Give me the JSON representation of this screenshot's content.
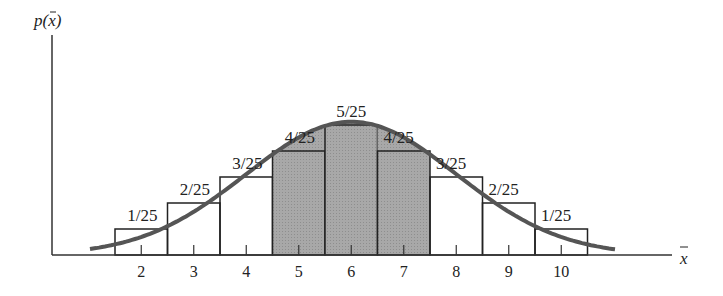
{
  "chart_data": {
    "type": "bar",
    "title": "",
    "xlabel": "x̄",
    "ylabel": "p(x̄)",
    "categories": [
      "2",
      "3",
      "4",
      "5",
      "6",
      "7",
      "8",
      "9",
      "10"
    ],
    "values": [
      0.04,
      0.08,
      0.12,
      0.16,
      0.2,
      0.16,
      0.12,
      0.08,
      0.04
    ],
    "value_labels": [
      "1/25",
      "2/25",
      "3/25",
      "4/25",
      "5/25",
      "4/25",
      "3/25",
      "2/25",
      "1/25"
    ],
    "shaded_categories": [
      "5",
      "6",
      "7"
    ],
    "overlay": "normal curve approximating the distribution",
    "ylim": [
      0,
      0.24
    ],
    "grid": false
  },
  "axes": {
    "y_label": "p(",
    "y_label_var": "x",
    "y_label_close": ")",
    "x_label": "x"
  }
}
